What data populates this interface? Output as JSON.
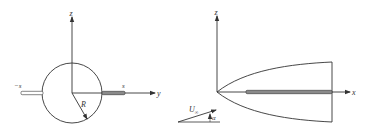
{
  "left_figure": {
    "axis_z_label": "z",
    "axis_y_label": "y",
    "radius_label": "R",
    "right_span_label": "s",
    "left_span_label": "−s"
  },
  "right_figure": {
    "axis_z_label": "z",
    "axis_x_label": "x",
    "freestream_label": "U",
    "freestream_subscript": "∞",
    "angle_label": "α"
  },
  "colors": {
    "ink": "#333333",
    "wing_fill": "#8a8a8a",
    "background": "#ffffff"
  }
}
